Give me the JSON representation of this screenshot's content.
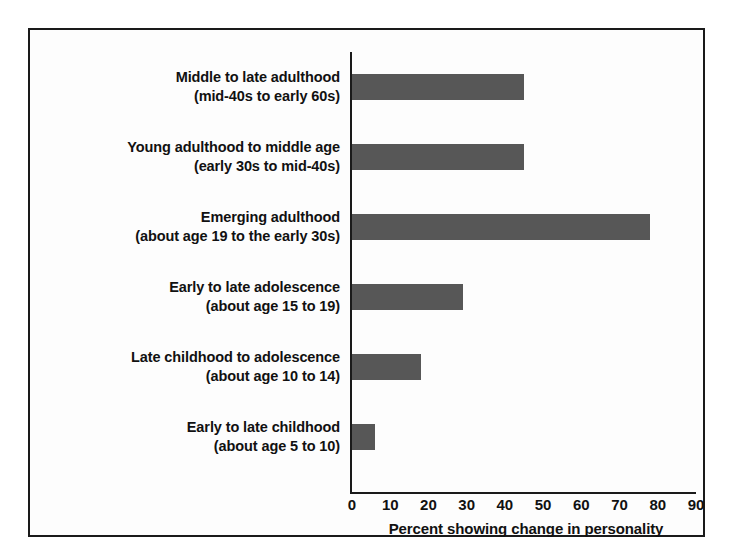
{
  "chart_data": {
    "type": "bar",
    "orientation": "horizontal",
    "title": "",
    "subtitle": "",
    "xlabel": "Percent showing change in personality",
    "ylabel": "",
    "xlim": [
      0,
      90
    ],
    "xticks": [
      0,
      10,
      20,
      30,
      40,
      50,
      60,
      70,
      80,
      90
    ],
    "xtick_labels": [
      "0",
      "10",
      "20",
      "30",
      "40",
      "50",
      "60",
      "70",
      "80",
      "90"
    ],
    "grid": false,
    "legend": null,
    "bar_color": "#575757",
    "axis_color": "#1a1a1a",
    "frame_color": "#1a1a1a",
    "background": "#fdfdfd",
    "categories": [
      "Middle to late adulthood (mid-40s to early 60s)",
      "Young adulthood to middle age (early 30s to mid-40s)",
      "Emerging adulthood (about age 19 to the early 30s)",
      "Early to late adolescence (about age 15 to 19)",
      "Late childhood to adolescence (about age 10 to 14)",
      "Early to late childhood (about age 5 to 10)"
    ],
    "values": [
      45,
      45,
      78,
      29,
      18,
      6
    ]
  },
  "rows": [
    {
      "line1": "Middle to late adulthood",
      "line2": "(mid-40s to early 60s)",
      "value": 45
    },
    {
      "line1": "Young adulthood to middle age",
      "line2": "(early 30s to mid-40s)",
      "value": 45
    },
    {
      "line1": "Emerging adulthood",
      "line2": "(about age 19 to the early 30s)",
      "value": 78
    },
    {
      "line1": "Early to late adolescence",
      "line2": "(about age 15 to 19)",
      "value": 29
    },
    {
      "line1": "Late childhood to adolescence",
      "line2": "(about age 10 to 14)",
      "value": 18
    },
    {
      "line1": "Early to late childhood",
      "line2": "(about age 5 to 10)",
      "value": 6
    }
  ],
  "axis": {
    "title": "Percent showing change in personality",
    "ticks": [
      "0",
      "10",
      "20",
      "30",
      "40",
      "50",
      "60",
      "70",
      "80",
      "90"
    ]
  }
}
